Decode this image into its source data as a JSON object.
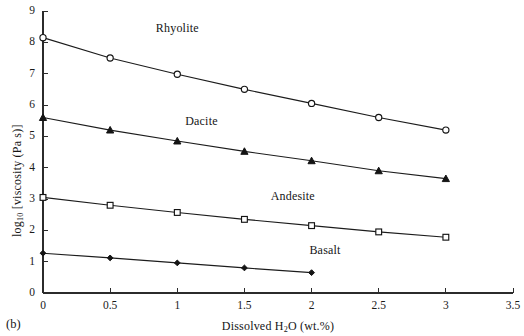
{
  "panel": {
    "label": "(b)"
  },
  "chart_data": {
    "type": "line",
    "title": "",
    "xlabel_parts": {
      "before": "Dissolved H",
      "sub": "2",
      "after": "O (wt.%)"
    },
    "xlabel": "Dissolved H2O (wt.%)",
    "ylabel_parts": {
      "before": "log",
      "sub": "10",
      "after": " [viscosity (Pa s)]"
    },
    "ylabel": "log10 [viscosity (Pa s)]",
    "xlim": [
      0,
      3.5
    ],
    "ylim": [
      0,
      9
    ],
    "xticks": [
      0,
      0.5,
      1,
      1.5,
      2,
      2.5,
      3,
      3.5
    ],
    "xtick_labels": [
      "0",
      "0.5",
      "1",
      "1.5",
      "2",
      "2.5",
      "3",
      "3.5"
    ],
    "yticks": [
      0,
      1,
      2,
      3,
      4,
      5,
      6,
      7,
      8,
      9
    ],
    "ytick_labels": [
      "0",
      "1",
      "2",
      "3",
      "4",
      "5",
      "6",
      "7",
      "8",
      "9"
    ],
    "grid": false,
    "legend": "inline-annotations",
    "series": [
      {
        "name": "Rhyolite",
        "marker": "open-circle",
        "color": "#141414",
        "x": [
          0,
          0.5,
          1,
          1.5,
          2,
          2.5,
          3
        ],
        "values": [
          8.15,
          7.5,
          6.98,
          6.5,
          6.05,
          5.6,
          5.2
        ],
        "label_x": 1.0,
        "label_y": 8.45
      },
      {
        "name": "Dacite",
        "marker": "filled-triangle",
        "color": "#141414",
        "x": [
          0,
          0.5,
          1,
          1.5,
          2,
          2.5,
          3
        ],
        "values": [
          5.6,
          5.2,
          4.85,
          4.52,
          4.22,
          3.9,
          3.65
        ],
        "label_x": 1.18,
        "label_y": 5.5
      },
      {
        "name": "Andesite",
        "marker": "open-square",
        "color": "#141414",
        "x": [
          0,
          0.5,
          1,
          1.5,
          2,
          2.5,
          3
        ],
        "values": [
          3.05,
          2.8,
          2.57,
          2.35,
          2.15,
          1.95,
          1.78
        ],
        "label_x": 1.86,
        "label_y": 3.08
      },
      {
        "name": "Basalt",
        "marker": "filled-diamond",
        "color": "#141414",
        "x": [
          0,
          0.5,
          1,
          1.5,
          2
        ],
        "values": [
          1.27,
          1.12,
          0.96,
          0.8,
          0.65
        ],
        "label_x": 2.1,
        "label_y": 1.38
      }
    ]
  }
}
